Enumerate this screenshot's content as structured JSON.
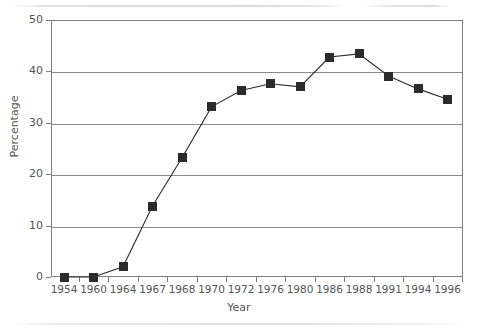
{
  "chart_data": {
    "type": "line",
    "title": "",
    "subtitle": "",
    "xlabel": "Year",
    "ylabel": "Percentage",
    "categories": [
      "1954",
      "1960",
      "1964",
      "1967",
      "1968",
      "1970",
      "1972",
      "1976",
      "1980",
      "1986",
      "1988",
      "1991",
      "1994",
      "1996"
    ],
    "values": [
      0,
      0,
      2,
      13.8,
      23.2,
      33.1,
      36.3,
      37.6,
      37.0,
      42.8,
      43.4,
      39.1,
      36.6,
      34.6
    ],
    "series": [
      {
        "name": "Percentage",
        "values": [
          0,
          0,
          2,
          13.8,
          23.2,
          33.1,
          36.3,
          37.6,
          37.0,
          42.8,
          43.4,
          39.1,
          36.6,
          34.6
        ],
        "marker": "filled-square",
        "color": "#2b2b2b"
      }
    ],
    "ylim": [
      0,
      50
    ],
    "yticks": [
      0,
      10,
      20,
      30,
      40,
      50
    ],
    "ytick_labels": [
      "0",
      "10",
      "20",
      "30",
      "40",
      "50"
    ],
    "grid": true,
    "grid_axis": "y",
    "legend": false,
    "legend_position": "none",
    "annotations": []
  },
  "style": {
    "line_color": "#2b2b2b",
    "marker_color": "#2b2b2b",
    "grid_color": "#8c8c8c",
    "axis_color": "#7d7d7d",
    "text_color": "#555555",
    "background": "#ffffff"
  }
}
